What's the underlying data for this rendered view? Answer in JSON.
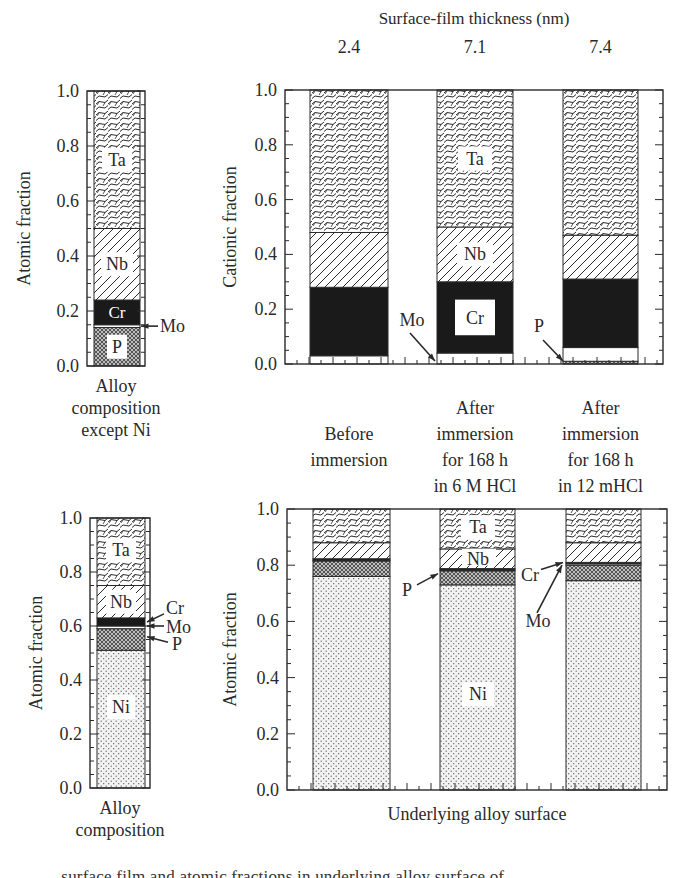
{
  "figure": {
    "top_title": "Surface-film thickness (nm)",
    "clipped_caption": "...surface film and atomic fractions in underlying alloy surface of..."
  },
  "colors": {
    "ink": "#2a2a2a",
    "bar_black": "#1a1a1a",
    "background": "#ffffff"
  },
  "chart_data": [
    {
      "id": "alloy-except-ni",
      "type": "bar",
      "stacked": true,
      "title": "",
      "ylabel": "Atomic fraction",
      "xlabel": "Alloy composition except Ni",
      "xlabel_lines": [
        "Alloy",
        "composition",
        "except Ni"
      ],
      "ylim": [
        0,
        1.0
      ],
      "yticks": [
        "0.0",
        "0.2",
        "0.4",
        "0.6",
        "0.8",
        "1.0"
      ],
      "categories": [
        "Alloy composition except Ni"
      ],
      "series": [
        {
          "name": "P",
          "values": [
            0.14
          ],
          "pattern": "crosshatch"
        },
        {
          "name": "Mo",
          "values": [
            0.01
          ],
          "pattern": "white"
        },
        {
          "name": "Cr",
          "values": [
            0.09
          ],
          "pattern": "black"
        },
        {
          "name": "Nb",
          "values": [
            0.26
          ],
          "pattern": "diagonal"
        },
        {
          "name": "Ta",
          "values": [
            0.5
          ],
          "pattern": "scales"
        }
      ],
      "annotations": [
        {
          "text": "Ta",
          "at": 0.75
        },
        {
          "text": "Nb",
          "at": 0.37
        },
        {
          "text": "Cr",
          "at": 0.195
        },
        {
          "text": "Mo",
          "arrow_to": 0.145
        },
        {
          "text": "P",
          "at": 0.07
        }
      ]
    },
    {
      "id": "surface-film",
      "type": "bar",
      "stacked": true,
      "title": "Surface-film thickness (nm)",
      "ylabel": "Cationic fraction",
      "xlabel": "",
      "ylim": [
        0,
        1.0
      ],
      "yticks": [
        "0.0",
        "0.2",
        "0.4",
        "0.6",
        "0.8",
        "1.0"
      ],
      "categories": [
        "Before immersion",
        "After immersion for 168 h in 6 M HCl",
        "After immersion for 168 h in 12 mHCl"
      ],
      "category_lines": [
        [
          "Before",
          "immersion"
        ],
        [
          "After",
          "immersion",
          "for 168 h",
          "in 6 M HCl"
        ],
        [
          "After",
          "immersion",
          "for 168 h",
          "in 12 mHCl"
        ]
      ],
      "top_labels": [
        "2.4",
        "7.1",
        "7.4"
      ],
      "series": [
        {
          "name": "P",
          "values": [
            0.0,
            0.0,
            0.01
          ],
          "pattern": "crosshatch"
        },
        {
          "name": "Mo",
          "values": [
            0.03,
            0.04,
            0.05
          ],
          "pattern": "white"
        },
        {
          "name": "Cr",
          "values": [
            0.25,
            0.26,
            0.25
          ],
          "pattern": "black"
        },
        {
          "name": "Nb",
          "values": [
            0.2,
            0.2,
            0.16
          ],
          "pattern": "diagonal"
        },
        {
          "name": "Ta",
          "values": [
            0.52,
            0.5,
            0.53
          ],
          "pattern": "scales"
        }
      ],
      "annotations": [
        {
          "text": "Mo",
          "arrow_to_bar": 1
        },
        {
          "text": "P",
          "arrow_to_bar": 2
        },
        {
          "text": "Ta",
          "bar": 1,
          "at": 0.75
        },
        {
          "text": "Nb",
          "bar": 1,
          "at": 0.4
        },
        {
          "text": "Cr",
          "bar": 1,
          "at": 0.17
        }
      ]
    },
    {
      "id": "alloy-composition",
      "type": "bar",
      "stacked": true,
      "title": "",
      "ylabel": "Atomic fraction",
      "xlabel": "Alloy composition",
      "xlabel_lines": [
        "Alloy",
        "composition"
      ],
      "ylim": [
        0,
        1.0
      ],
      "yticks": [
        "0.0",
        "0.2",
        "0.4",
        "0.6",
        "0.8",
        "1.0"
      ],
      "categories": [
        "Alloy composition"
      ],
      "series": [
        {
          "name": "Ni",
          "values": [
            0.51
          ],
          "pattern": "dots"
        },
        {
          "name": "P",
          "values": [
            0.08
          ],
          "pattern": "crosshatch"
        },
        {
          "name": "Mo",
          "values": [
            0.01
          ],
          "pattern": "white"
        },
        {
          "name": "Cr",
          "values": [
            0.03
          ],
          "pattern": "black"
        },
        {
          "name": "Nb",
          "values": [
            0.12
          ],
          "pattern": "diagonal"
        },
        {
          "name": "Ta",
          "values": [
            0.25
          ],
          "pattern": "scales"
        }
      ],
      "annotations": [
        {
          "text": "Ta",
          "at": 0.88
        },
        {
          "text": "Nb",
          "at": 0.69
        },
        {
          "text": "Cr",
          "arrow_to": 0.615
        },
        {
          "text": "Mo",
          "arrow_to": 0.6
        },
        {
          "text": "P",
          "arrow_to": 0.55
        },
        {
          "text": "Ni",
          "at": 0.3
        }
      ]
    },
    {
      "id": "underlying-alloy",
      "type": "bar",
      "stacked": true,
      "title": "",
      "ylabel": "Atomic fraction",
      "xlabel": "Underlying alloy surface",
      "ylim": [
        0,
        1.0
      ],
      "yticks": [
        "0.0",
        "0.2",
        "0.4",
        "0.6",
        "0.8",
        "1.0"
      ],
      "categories": [
        "Before immersion",
        "After immersion for 168 h in 6 M HCl",
        "After immersion for 168 h in 12 mHCl"
      ],
      "series": [
        {
          "name": "Ni",
          "values": [
            0.76,
            0.73,
            0.745
          ],
          "pattern": "dots"
        },
        {
          "name": "P",
          "values": [
            0.055,
            0.05,
            0.055
          ],
          "pattern": "crosshatch"
        },
        {
          "name": "Mo",
          "values": [
            0.003,
            0.003,
            0.005
          ],
          "pattern": "white"
        },
        {
          "name": "Cr",
          "values": [
            0.005,
            0.005,
            0.005
          ],
          "pattern": "black"
        },
        {
          "name": "Nb",
          "values": [
            0.057,
            0.07,
            0.07
          ],
          "pattern": "diagonal"
        },
        {
          "name": "Ta",
          "values": [
            0.12,
            0.142,
            0.12
          ],
          "pattern": "scales"
        }
      ],
      "annotations": [
        {
          "text": "P",
          "arrow_to_bar": 1
        },
        {
          "text": "Cr",
          "arrow_to_bar": 2
        },
        {
          "text": "Mo",
          "arrow_to_bar": 2
        },
        {
          "text": "Ta",
          "bar": 1,
          "at": 0.93
        },
        {
          "text": "Nb",
          "bar": 1,
          "at": 0.82
        },
        {
          "text": "Ni",
          "bar": 1,
          "at": 0.34
        }
      ]
    }
  ]
}
